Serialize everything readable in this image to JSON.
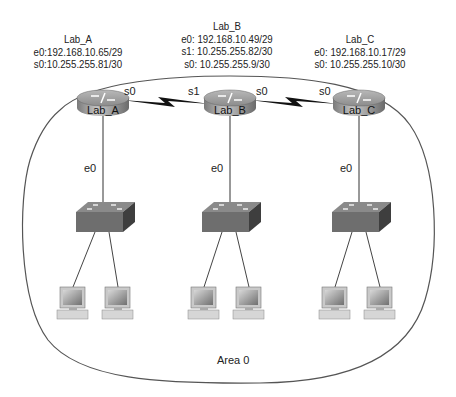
{
  "routers": [
    {
      "name": "Lab_A",
      "interfaces": [
        "e0:192.168.10.65/29",
        "s0:10.255.255.81/30"
      ],
      "ports": {
        "serial_right": "s0",
        "ethernet": "e0"
      }
    },
    {
      "name": "Lab_B",
      "interfaces": [
        "e0: 192.168.10.49/29",
        "s1: 10.255.255.82/30",
        "s0: 10.255.255.9/30"
      ],
      "ports": {
        "serial_left": "s1",
        "serial_right": "s0",
        "ethernet": "e0"
      }
    },
    {
      "name": "Lab_C",
      "interfaces": [
        "e0: 192.168.10.17/29",
        "s0: 10.255.255.10/30"
      ],
      "ports": {
        "serial_left": "s0",
        "ethernet": "e0"
      }
    }
  ],
  "router_icon_labels": [
    "Lab_A",
    "Lab_B",
    "Lab_C"
  ],
  "area": {
    "label": "Area 0"
  },
  "links": [
    {
      "from": "Lab_A s0",
      "to": "Lab_B s1",
      "type": "serial"
    },
    {
      "from": "Lab_B s0",
      "to": "Lab_C s0",
      "type": "serial"
    }
  ],
  "colors": {
    "router": "#8a8a8a",
    "switch": "#6e6e6e",
    "line": "#333333",
    "background": "#ffffff"
  }
}
